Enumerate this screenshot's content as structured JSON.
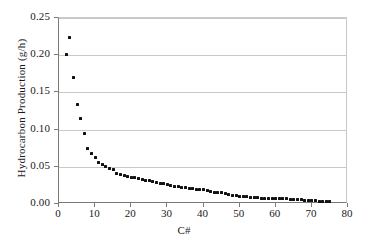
{
  "chart_data": {
    "type": "scatter",
    "title": "",
    "xlabel": "C#",
    "ylabel": "Hydrocarbon Production (g/h)",
    "xlim": [
      0,
      80
    ],
    "ylim": [
      0,
      0.25
    ],
    "xticks": [
      0,
      10,
      20,
      30,
      40,
      50,
      60,
      70,
      80
    ],
    "xtick_labels": [
      "0",
      "10",
      "20",
      "30",
      "40",
      "50",
      "60",
      "70",
      "80"
    ],
    "yticks": [
      0.0,
      0.05,
      0.1,
      0.15,
      0.2,
      0.25
    ],
    "ytick_labels": [
      "0.00",
      "0.05",
      "0.10",
      "0.15",
      "0.20",
      "0.25"
    ],
    "grid": "horizontal",
    "legend": "none",
    "marker": "filled-square",
    "marker_color": "#111111",
    "series": [
      {
        "name": "Hydrocarbon Production",
        "x": [
          2,
          3,
          4,
          5,
          6,
          7,
          8,
          9,
          10,
          11,
          12,
          13,
          14,
          15,
          16,
          17,
          18,
          19,
          20,
          21,
          22,
          23,
          24,
          25,
          26,
          27,
          28,
          29,
          30,
          31,
          32,
          33,
          34,
          35,
          36,
          37,
          38,
          39,
          40,
          41,
          42,
          43,
          44,
          45,
          46,
          47,
          48,
          49,
          50,
          51,
          52,
          53,
          54,
          55,
          56,
          57,
          58,
          59,
          60,
          61,
          62,
          63,
          64,
          65,
          66,
          67,
          68,
          69,
          70,
          71,
          72,
          73,
          74,
          75
        ],
        "y": [
          0.201,
          0.224,
          0.17,
          0.134,
          0.115,
          0.095,
          0.074,
          0.068,
          0.062,
          0.056,
          0.053,
          0.05,
          0.048,
          0.046,
          0.041,
          0.039,
          0.038,
          0.037,
          0.036,
          0.035,
          0.034,
          0.033,
          0.032,
          0.031,
          0.03,
          0.029,
          0.028,
          0.027,
          0.026,
          0.025,
          0.024,
          0.023,
          0.022,
          0.022,
          0.021,
          0.021,
          0.02,
          0.02,
          0.019,
          0.018,
          0.017,
          0.016,
          0.016,
          0.015,
          0.014,
          0.013,
          0.012,
          0.011,
          0.01,
          0.01,
          0.01,
          0.009,
          0.009,
          0.009,
          0.008,
          0.008,
          0.008,
          0.008,
          0.007,
          0.007,
          0.007,
          0.007,
          0.006,
          0.006,
          0.006,
          0.006,
          0.005,
          0.005,
          0.005,
          0.005,
          0.004,
          0.004,
          0.004,
          0.004
        ]
      }
    ]
  }
}
